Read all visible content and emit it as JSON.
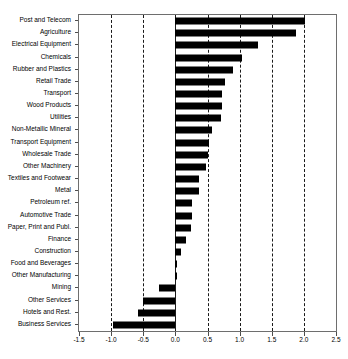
{
  "chart_data": {
    "type": "bar",
    "orientation": "horizontal",
    "title": "",
    "subtitle": "",
    "xlabel": "",
    "ylabel": "",
    "xlim": [
      -1.5,
      2.5
    ],
    "xticks": [
      -1.5,
      -1.0,
      -0.5,
      0.0,
      0.5,
      1.0,
      1.5,
      2.0,
      2.5
    ],
    "xtick_labels": [
      "-1.5",
      "-1.0",
      "-0.5",
      "0.0",
      "0.5",
      "1.0",
      "1.5",
      "2.0",
      "2.5"
    ],
    "grid": "vertical-dashed",
    "legend": "none",
    "bar_color": "#000000",
    "categories": [
      "Post and Telecom",
      "Agriculture",
      "Electrical Equipment",
      "Chemicals",
      "Rubber and Plastics",
      "Retail Trade",
      "Transport",
      "Wood Products",
      "Utilities",
      "Non-Metallic Mineral",
      "Transport Equipment",
      "Wholesale Trade",
      "Other Machinery",
      "Textiles and Footwear",
      "Metal",
      "Petroleum ref.",
      "Automotive Trade",
      "Paper, Print and Publ.",
      "Finance",
      "Construction",
      "Food and Beverages",
      "Other Manufacturing",
      "Mining",
      "Other Services",
      "Hotels and Rest.",
      "Business Services"
    ],
    "values": [
      2.01,
      1.88,
      1.29,
      1.04,
      0.89,
      0.77,
      0.72,
      0.72,
      0.71,
      0.57,
      0.53,
      0.5,
      0.48,
      0.37,
      0.37,
      0.26,
      0.26,
      0.24,
      0.17,
      0.09,
      0.03,
      0.03,
      -0.25,
      -0.51,
      -0.58,
      -0.97
    ]
  }
}
